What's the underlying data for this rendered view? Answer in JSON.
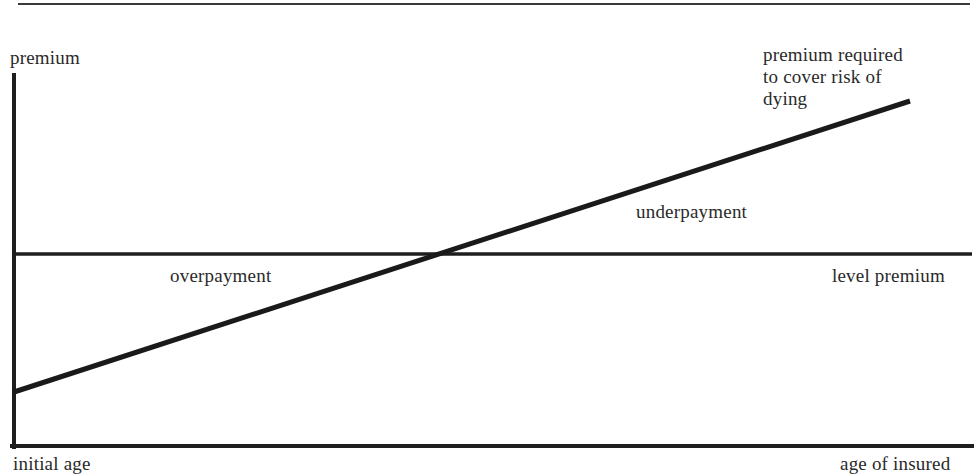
{
  "diagram": {
    "type": "line-comparison",
    "colors": {
      "ink": "#1e1e1e",
      "text": "#2a2a2a",
      "background": "#ffffff"
    },
    "labels": {
      "y_axis": "premium",
      "x_axis_start": "initial age",
      "x_axis_end": "age of insured",
      "rising_line": "premium required\nto cover risk of\ndying",
      "level_line": "level premium",
      "region_left": "overpayment",
      "region_right": "underpayment"
    },
    "geometry": {
      "top_rule": {
        "x1": 18,
        "y1": 4,
        "x2": 970,
        "y2": 4,
        "width": 2
      },
      "y_axis": {
        "x1": 14,
        "y1": 75,
        "x2": 14,
        "y2": 447,
        "width": 4
      },
      "x_axis": {
        "x1": 12,
        "y1": 446,
        "x2": 972,
        "y2": 446,
        "width": 4
      },
      "level_premium_line": {
        "x1": 14,
        "y1": 254,
        "x2": 972,
        "y2": 254,
        "width": 3.5
      },
      "risk_premium_line": {
        "x1": 14,
        "y1": 392,
        "x2": 910,
        "y2": 101,
        "width": 5
      }
    }
  },
  "chart_data": {
    "type": "line",
    "title": "",
    "xlabel": "age of insured",
    "ylabel": "premium",
    "x_tick_labels": [
      "initial age"
    ],
    "series": [
      {
        "name": "premium required to cover risk of dying",
        "shape": "increasing linear",
        "x": [
          0,
          1
        ],
        "y": [
          0.2,
          0.95
        ]
      },
      {
        "name": "level premium",
        "shape": "constant",
        "x": [
          0,
          1
        ],
        "y": [
          0.55,
          0.55
        ]
      }
    ],
    "annotations": [
      {
        "text": "overpayment",
        "region": "left of intersection, level premium above required premium"
      },
      {
        "text": "underpayment",
        "region": "right of intersection, required premium above level premium"
      }
    ],
    "intersection_x_fraction": 0.45,
    "grid": false,
    "legend": "none (lines labelled directly)"
  }
}
